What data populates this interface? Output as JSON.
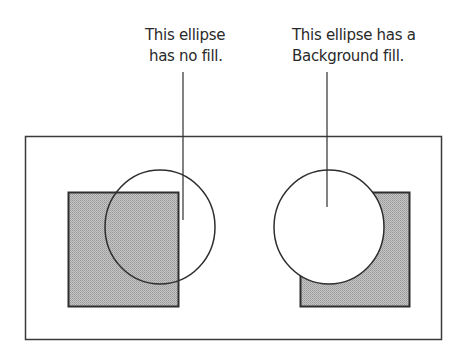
{
  "captions": {
    "left": {
      "line1": "This ellipse",
      "line2": "has no fill."
    },
    "right": {
      "line1": "This ellipse has a",
      "line2": "Background fill."
    }
  },
  "colors": {
    "stroke": "#3a3a3a",
    "square_fill": "#b4b4b4",
    "ellipse_bg_fill": "#ffffff",
    "background": "#ffffff"
  },
  "figure": {
    "frame": {
      "x": 25,
      "y": 136,
      "width": 416,
      "height": 203
    },
    "left_square": {
      "x": 68,
      "y": 192,
      "width": 110,
      "height": 114
    },
    "left_ellipse": {
      "cx": 160,
      "cy": 227,
      "rx": 55,
      "ry": 57,
      "fill": "none"
    },
    "left_leader": {
      "x": 183,
      "y1": 72,
      "y2": 220
    },
    "right_square": {
      "x": 300,
      "y": 192,
      "width": 109,
      "height": 114
    },
    "right_ellipse": {
      "cx": 329,
      "cy": 227,
      "rx": 55,
      "ry": 57,
      "fill": "background"
    },
    "right_leader": {
      "x": 327,
      "y1": 72,
      "y2": 207
    }
  }
}
